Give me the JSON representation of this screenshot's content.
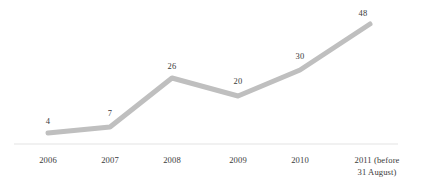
{
  "chart_data": {
    "type": "line",
    "title": "",
    "subtitle": "",
    "xlabel": "",
    "ylabel": "",
    "grid": false,
    "legend": null,
    "legend_position": "none",
    "categories": [
      "2006",
      "2007",
      "2008",
      "2009",
      "2010",
      "2011 (before\n31 August)"
    ],
    "tick_labels": [
      "2006",
      "2007",
      "2008",
      "2009",
      "2010",
      "2011 (before\n31 August)"
    ],
    "values": [
      4,
      7,
      26,
      20,
      30,
      48
    ],
    "data_labels": [
      "4",
      "7",
      "26",
      "20",
      "30",
      "48"
    ],
    "series": [
      {
        "name": "",
        "values": [
          4,
          7,
          26,
          20,
          30,
          48
        ],
        "color": "#bfbfbf",
        "line_width": 5,
        "markers": false
      }
    ],
    "ylim": [
      0,
      50
    ],
    "axis_line_color": "#e3e3e3",
    "label_color": "#3a3a3a",
    "points_px": [
      {
        "x": 48,
        "y": 133
      },
      {
        "x": 110,
        "y": 127
      },
      {
        "x": 172,
        "y": 78
      },
      {
        "x": 238,
        "y": 96
      },
      {
        "x": 300,
        "y": 70
      },
      {
        "x": 370,
        "y": 24
      }
    ],
    "label_px": [
      {
        "x": 48,
        "y": 116
      },
      {
        "x": 110,
        "y": 108
      },
      {
        "x": 172,
        "y": 61
      },
      {
        "x": 238,
        "y": 76
      },
      {
        "x": 300,
        "y": 51
      },
      {
        "x": 363,
        "y": 8
      }
    ],
    "tick_px": [
      {
        "x": 48,
        "y": 155
      },
      {
        "x": 110,
        "y": 155
      },
      {
        "x": 172,
        "y": 155
      },
      {
        "x": 238,
        "y": 155
      },
      {
        "x": 300,
        "y": 155
      },
      {
        "x": 377,
        "y": 155
      }
    ],
    "axis_px": {
      "x1": 14,
      "x2": 398,
      "y": 144
    }
  }
}
